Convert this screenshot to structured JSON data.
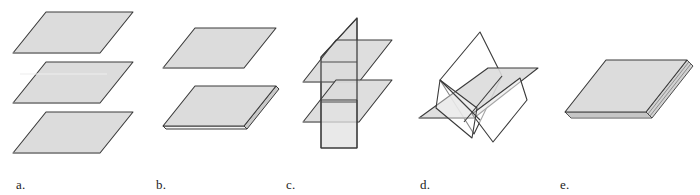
{
  "figure": {
    "background_color": "#ffffff",
    "panel_count": 5
  },
  "style": {
    "plane_fill": "#dcdcdc",
    "plane_fill_white": "#ffffff",
    "plane_edge": "#3a3a3a",
    "plane_edge_light": "#6e6e6e",
    "edge_highlight": "#f2f2f2",
    "label_color": "#1c1c1c"
  },
  "panels": [
    {
      "id": "a",
      "label": "a.",
      "description": "Three distinct parallel planes, stacked and separated",
      "plane_count": 3,
      "arrangement": "parallel-separated",
      "shaded": true
    },
    {
      "id": "b",
      "label": "b.",
      "description": "One plane above a slab of two coincident planes",
      "plane_count": 3,
      "arrangement": "parallel-two-coincident",
      "shaded": true
    },
    {
      "id": "c",
      "label": "c.",
      "description": "Two parallel horizontal planes cut by a vertical plane",
      "plane_count": 3,
      "arrangement": "two-parallel-one-intersecting",
      "shaded": true
    },
    {
      "id": "d",
      "label": "d.",
      "description": "Three planes intersecting pairwise in distinct lines",
      "plane_count": 3,
      "arrangement": "three-mutually-intersecting",
      "shaded": true
    },
    {
      "id": "e",
      "label": "e.",
      "description": "Three coincident planes forming a single thin slab",
      "plane_count": 3,
      "arrangement": "coincident-slab",
      "shaded": true
    }
  ]
}
